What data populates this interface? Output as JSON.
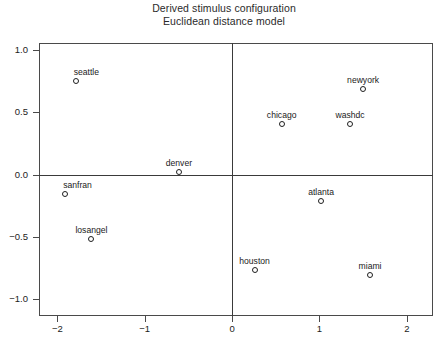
{
  "chart_data": {
    "type": "scatter",
    "title": "Derived stimulus configuration",
    "subtitle": "Euclidean distance model",
    "xlabel": "",
    "ylabel": "",
    "xlim": [
      -2.21,
      2.3
    ],
    "ylim": [
      -1.14,
      1.06
    ],
    "grid": false,
    "legend": "none",
    "xticks": [
      -2,
      -1,
      0,
      1,
      2
    ],
    "xtick_labels": [
      "-2",
      "-1",
      "0",
      "1",
      "2"
    ],
    "yticks": [
      -1.0,
      -0.5,
      0.0,
      0.5,
      1.0
    ],
    "ytick_labels": [
      "-1.0",
      "-0.5",
      "0.0",
      "0.5",
      "1.0"
    ],
    "axis_cross_lines": {
      "x": 0,
      "y": 0
    },
    "points": [
      {
        "label": "seattle",
        "x": -1.79,
        "y": 0.75,
        "label_pos": "above-right"
      },
      {
        "label": "newyork",
        "x": 1.5,
        "y": 0.69,
        "label_pos": "above"
      },
      {
        "label": "chicago",
        "x": 0.57,
        "y": 0.41,
        "label_pos": "above"
      },
      {
        "label": "washdc",
        "x": 1.35,
        "y": 0.41,
        "label_pos": "above"
      },
      {
        "label": "denver",
        "x": -0.61,
        "y": 0.02,
        "label_pos": "above"
      },
      {
        "label": "sanfran",
        "x": -1.91,
        "y": -0.16,
        "label_pos": "above-right"
      },
      {
        "label": "atlanta",
        "x": 1.02,
        "y": -0.21,
        "label_pos": "above"
      },
      {
        "label": "losangel",
        "x": -1.61,
        "y": -0.52,
        "label_pos": "above"
      },
      {
        "label": "houston",
        "x": 0.26,
        "y": -0.77,
        "label_pos": "above"
      },
      {
        "label": "miami",
        "x": 1.58,
        "y": -0.81,
        "label_pos": "above"
      }
    ]
  },
  "colors": {
    "frame": "#4a4a4a",
    "axis": "#3a3a3a",
    "marker": "#1f1f1f",
    "text": "#1a1a1a",
    "background": "#ffffff"
  }
}
